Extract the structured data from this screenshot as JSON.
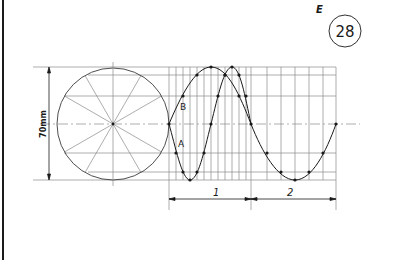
{
  "header": {
    "section_letter": "E",
    "figure_number": "28"
  },
  "diagram": {
    "dimension_vertical": "70mm",
    "curve_labels": {
      "a": "A",
      "b": "B"
    },
    "period_labels": [
      "1",
      "2"
    ],
    "circle_divisions": 12,
    "colors": {
      "ink": "#1a1a1a",
      "construction": "#8a8a8a"
    }
  }
}
